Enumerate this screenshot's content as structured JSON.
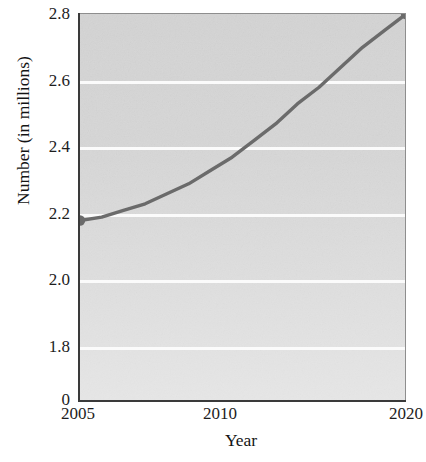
{
  "chart_data": {
    "type": "line",
    "title": "",
    "xlabel": "Year",
    "ylabel": "Number (in millions)",
    "x": [
      2005,
      2006,
      2007,
      2008,
      2009,
      2010,
      2011,
      2012,
      2013,
      2014,
      2015,
      2016,
      2017,
      2018,
      2019,
      2020
    ],
    "series": [
      {
        "name": "Number (in millions)",
        "values": [
          2.18,
          2.19,
          2.21,
          2.23,
          2.26,
          2.29,
          2.33,
          2.37,
          2.42,
          2.47,
          2.53,
          2.58,
          2.64,
          2.7,
          2.75,
          2.8
        ]
      }
    ],
    "xlim": [
      2005,
      2020
    ],
    "ylim": [
      1.7,
      2.8
    ],
    "xticks": [
      2005,
      2010,
      2020
    ],
    "xtick_labels": [
      "2005",
      "2010",
      "2020"
    ],
    "yticks": [
      0,
      1.8,
      2.0,
      2.2,
      2.4,
      2.6,
      2.8
    ],
    "ytick_labels": [
      "0",
      "1.8",
      "2.0",
      "2.2",
      "2.4",
      "2.6",
      "2.8"
    ],
    "y_axis_break": true,
    "gridlines": [
      1.8,
      2.0,
      2.2,
      2.4,
      2.6,
      2.8
    ],
    "grid": "horizontal",
    "legend": "none",
    "markers": [
      {
        "label": "start-point",
        "x": 2005,
        "y": 2.18
      },
      {
        "label": "end-point",
        "x": 2020,
        "y": 2.8
      }
    ],
    "colors": {
      "line": "#6b6b6b",
      "marker": "#6b6b6b",
      "panel_background": "#d4d4d4",
      "gridline": "#fbfbfb",
      "axis": "#3a3a3a",
      "text": "#1d1d1d"
    }
  }
}
